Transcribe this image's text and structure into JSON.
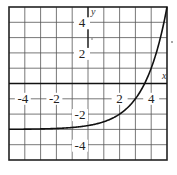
{
  "chart_data": {
    "type": "line",
    "title": "",
    "xlabel": "x",
    "ylabel": "y",
    "xlim": [
      -5,
      5
    ],
    "ylim": [
      -5,
      5
    ],
    "grid": true,
    "x_tick_labels": [
      "-4",
      "-2",
      "2",
      "4"
    ],
    "y_tick_labels": [
      "4",
      "2",
      "-2",
      "-4"
    ],
    "series": [
      {
        "name": "f(x) = 2^(x-2) - 3",
        "x": [
          -5,
          -4,
          -3,
          -2,
          -1,
          0,
          1,
          2,
          3,
          3.58,
          4,
          4.5,
          5
        ],
        "y": [
          -2.99,
          -2.98,
          -2.97,
          -2.94,
          -2.88,
          -2.75,
          -2.5,
          -2,
          -1,
          0,
          1,
          2.66,
          5
        ]
      }
    ],
    "asymptote": {
      "y": -3
    },
    "colors": {
      "grid": "#555555",
      "curve": "#111111",
      "background": "#ffffff"
    }
  }
}
